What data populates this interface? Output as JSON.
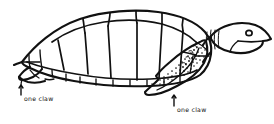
{
  "figure": {
    "view": "left profile",
    "style": "hand-drawn black ink line art",
    "background_color": "#ffffff",
    "ink_color": "#111111"
  },
  "annotations": [
    {
      "id": "rear-flipper-claw",
      "text": "one claw",
      "points_to": "rear flipper",
      "position": "lower-left"
    },
    {
      "id": "front-flipper-claw",
      "text": "one claw",
      "points_to": "front flipper",
      "position": "lower-center-right"
    }
  ],
  "parts": {
    "shell": "carapace with polygonal scutes",
    "marginal_scutes": "row of small scutes along lower shell edge",
    "head": "head with round eye and beak",
    "neck": "neck with vertical hatch lines",
    "front_flipper": "front flipper with stippled scale texture",
    "rear_flipper": "rear flipper at left"
  }
}
